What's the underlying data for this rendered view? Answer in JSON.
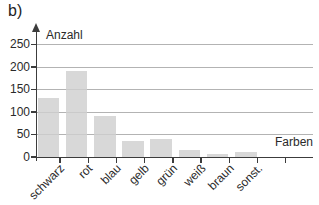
{
  "panel_label": "b)",
  "chart_data": {
    "type": "bar",
    "title": "",
    "ylabel": "Anzahl",
    "xlabel": "Farben",
    "categories": [
      "schwarz",
      "rot",
      "blau",
      "gelb",
      "grün",
      "weiß",
      "braun",
      "sonst."
    ],
    "values": [
      130,
      190,
      90,
      35,
      40,
      15,
      5,
      10
    ],
    "yticks": [
      0,
      50,
      100,
      150,
      200,
      250
    ],
    "ylim": [
      0,
      265
    ],
    "grid": true,
    "legend": "none",
    "bar_color": "#cfcfcf",
    "grid_color": "#b3b3b3",
    "axis_color": "#3c3c3c",
    "text_color": "#2a2a2a",
    "background_color": "#ffffff"
  }
}
